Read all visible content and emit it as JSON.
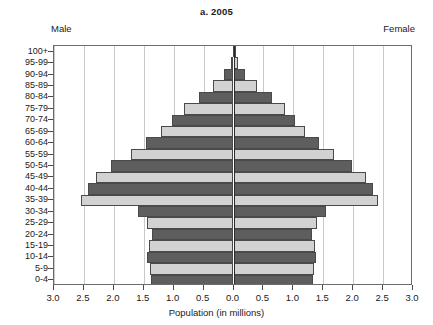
{
  "chart": {
    "title": "a. 2005",
    "male_label": "Male",
    "female_label": "Female",
    "xlabel": "Population (in millions)"
  },
  "chart_data": {
    "type": "bar",
    "subtype": "population-pyramid",
    "title": "a. 2005",
    "xlabel": "Population (in millions)",
    "ylabel": "",
    "xlim": [
      -3.0,
      3.0
    ],
    "xtick_labels": [
      "3.0",
      "2.5",
      "2.0",
      "1.5",
      "1.0",
      "0.5",
      "0.0",
      "0.5",
      "1.0",
      "1.5",
      "2.0",
      "2.5",
      "3.0"
    ],
    "xtick_values": [
      -3.0,
      -2.5,
      -2.0,
      -1.5,
      -1.0,
      -0.5,
      0.0,
      0.5,
      1.0,
      1.5,
      2.0,
      2.5,
      3.0
    ],
    "grid": true,
    "legend": false,
    "categories": [
      "0-4",
      "5-9",
      "10-14",
      "15-19",
      "20-24",
      "25-29",
      "30-34",
      "35-39",
      "40-44",
      "45-49",
      "50-54",
      "55-59",
      "60-64",
      "65-69",
      "70-74",
      "75-79",
      "80-84",
      "85-89",
      "90-94",
      "95-99",
      "100+"
    ],
    "series": [
      {
        "name": "Male",
        "side": "left",
        "values": [
          1.38,
          1.4,
          1.44,
          1.42,
          1.36,
          1.45,
          1.6,
          2.55,
          2.43,
          2.3,
          2.05,
          1.72,
          1.46,
          1.22,
          1.02,
          0.82,
          0.58,
          0.34,
          0.16,
          0.05,
          0.01
        ]
      },
      {
        "name": "Female",
        "side": "right",
        "values": [
          1.33,
          1.35,
          1.38,
          1.36,
          1.31,
          1.4,
          1.54,
          2.42,
          2.33,
          2.22,
          1.98,
          1.68,
          1.43,
          1.2,
          1.02,
          0.86,
          0.64,
          0.4,
          0.2,
          0.07,
          0.02
        ]
      }
    ],
    "bar_shading": [
      "dark",
      "light",
      "dark",
      "light",
      "dark",
      "light",
      "dark",
      "light",
      "dark",
      "light",
      "dark",
      "light",
      "dark",
      "light",
      "dark",
      "light",
      "dark",
      "light",
      "dark",
      "light",
      "dark"
    ],
    "colors": {
      "dark": "#5e5e5e",
      "light": "#d2d2d2",
      "outline": "#4a4a4a",
      "grid": "#c9c9c9",
      "center_axis": "#2b2b2b"
    }
  }
}
